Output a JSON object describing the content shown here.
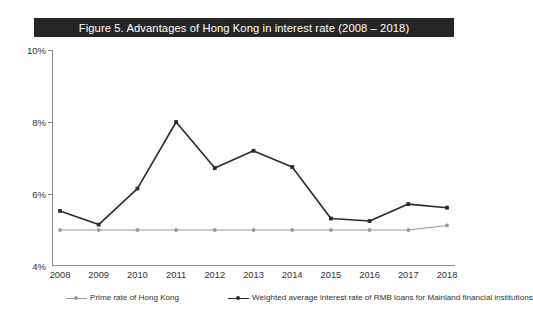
{
  "figure": {
    "title": "Figure 5.  Advantages of Hong Kong in interest rate (2008 – 2018)",
    "title_bg": "#262626",
    "title_color": "#ffffff"
  },
  "chart_data": {
    "type": "line",
    "title": "Figure 5.  Advantages of Hong Kong in interest rate (2008 – 2018)",
    "xlabel": "",
    "ylabel": "",
    "categories": [
      "2008",
      "2009",
      "2010",
      "2011",
      "2012",
      "2013",
      "2014",
      "2015",
      "2016",
      "2017",
      "2018"
    ],
    "x_tick_labels": [
      "2008",
      "2009",
      "2010",
      "2011",
      "2012",
      "2013",
      "2014",
      "2015",
      "2016",
      "2017",
      "2018"
    ],
    "y_tick_labels": [
      "4%",
      "6%",
      "8%",
      "10%"
    ],
    "y_ticks": [
      4,
      6,
      8,
      10
    ],
    "ylim": [
      4,
      10
    ],
    "y_unit": "%",
    "grid": false,
    "legend_position": "bottom",
    "series": [
      {
        "name": "Prime rate of Hong Kong",
        "color": "#9b9b9b",
        "marker": "circle",
        "values": [
          5.0,
          5.0,
          5.0,
          5.0,
          5.0,
          5.0,
          5.0,
          5.0,
          5.0,
          5.0,
          5.125
        ]
      },
      {
        "name": "Weighted average interest rate of RMB loans for Mainland financial institutions",
        "color": "#2b2b2b",
        "marker": "square",
        "values": [
          5.53,
          5.15,
          6.15,
          8.0,
          6.72,
          7.2,
          6.75,
          5.32,
          5.25,
          5.72,
          5.62
        ]
      }
    ]
  },
  "legend": {
    "items": [
      {
        "label": "Prime rate of Hong Kong",
        "color": "#9b9b9b"
      },
      {
        "label": "Weighted average interest rate of RMB loans for Mainland financial institutions",
        "color": "#2b2b2b"
      }
    ]
  }
}
